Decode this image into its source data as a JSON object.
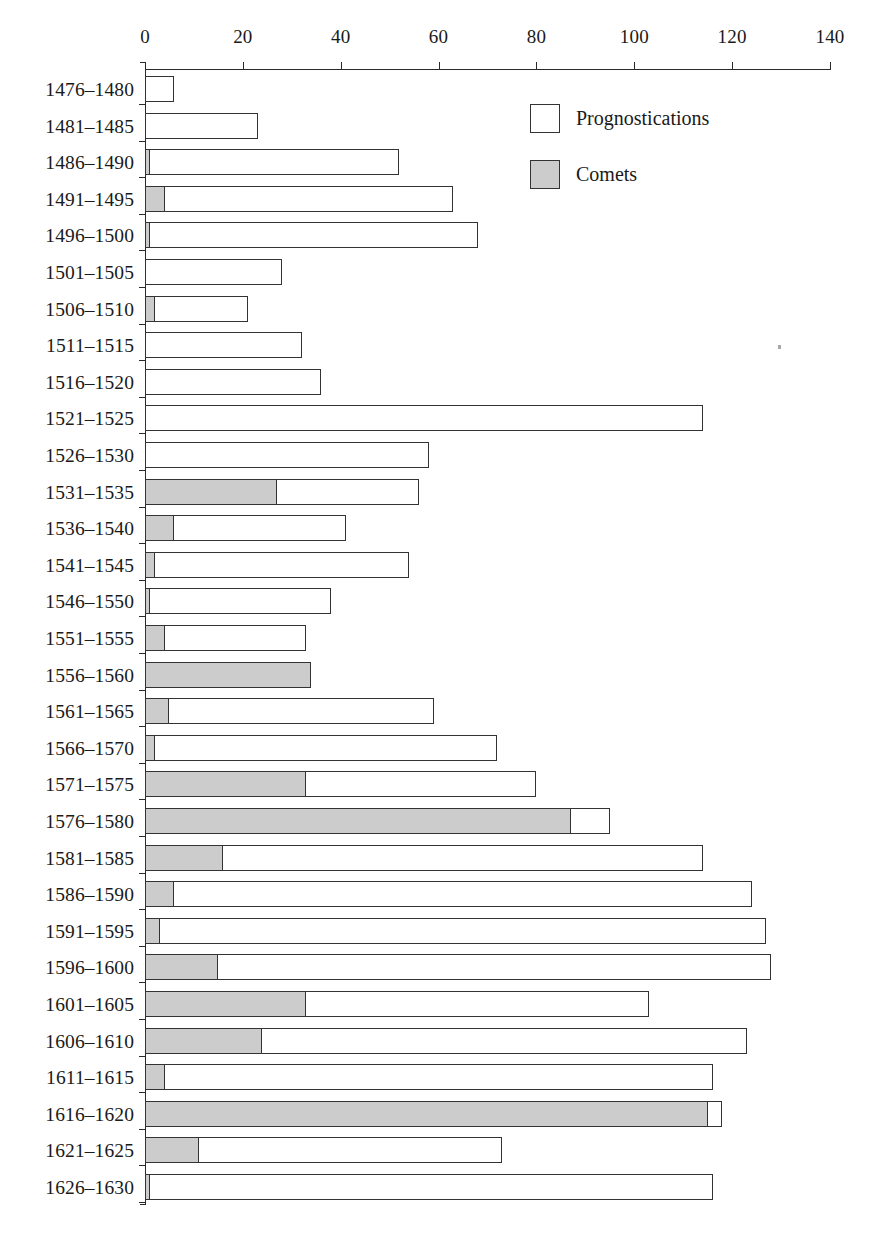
{
  "chart_data": {
    "type": "bar",
    "orientation": "horizontal",
    "stacked": true,
    "title": "",
    "subtitle": "",
    "xlabel": "",
    "ylabel": "",
    "xlim": [
      0,
      140
    ],
    "ylim": null,
    "grid": false,
    "legend_position": "upper right (inside plot area)",
    "axis_ticks": [
      0,
      20,
      40,
      60,
      80,
      100,
      120,
      140
    ],
    "categories": [
      "1476–1480",
      "1481–1485",
      "1486–1490",
      "1491–1495",
      "1496–1500",
      "1501–1505",
      "1506–1510",
      "1511–1515",
      "1516–1520",
      "1521–1525",
      "1526–1530",
      "1531–1535",
      "1536–1540",
      "1541–1545",
      "1546–1550",
      "1551–1555",
      "1556–1560",
      "1561–1565",
      "1566–1570",
      "1571–1575",
      "1576–1580",
      "1581–1585",
      "1586–1590",
      "1591–1595",
      "1596–1600",
      "1601–1605",
      "1606–1610",
      "1611–1615",
      "1616–1620",
      "1621–1625",
      "1626–1630"
    ],
    "series": [
      {
        "name": "Comets",
        "color": "#cccccc",
        "values": [
          0,
          0,
          1,
          4,
          1,
          0,
          2,
          0,
          0,
          0,
          0,
          27,
          6,
          2,
          1,
          4,
          34,
          5,
          2,
          33,
          87,
          16,
          6,
          3,
          15,
          33,
          24,
          4,
          115,
          11,
          1
        ]
      },
      {
        "name": "Prognostications",
        "color": "#ffffff",
        "values": [
          6,
          23,
          52,
          63,
          68,
          28,
          21,
          32,
          36,
          114,
          58,
          56,
          41,
          54,
          38,
          33,
          34,
          59,
          72,
          80,
          95,
          114,
          124,
          127,
          128,
          103,
          123,
          116,
          118,
          73,
          116
        ]
      }
    ],
    "note": "Prognostications series values are cumulative bar totals; the Comets segment is drawn first from the axis and the remainder of the bar is the unfilled (white) Prognostications portion."
  },
  "legend": {
    "items": [
      {
        "label": "Prognostications",
        "swatch": "white"
      },
      {
        "label": "Comets",
        "swatch": "gray"
      }
    ]
  },
  "colors": {
    "comets_fill": "#cccccc",
    "prognostications_fill": "#ffffff",
    "bar_stroke": "#333333",
    "axis": "#2a2a2a",
    "text": "#1a1a1a",
    "background": "#ffffff"
  }
}
